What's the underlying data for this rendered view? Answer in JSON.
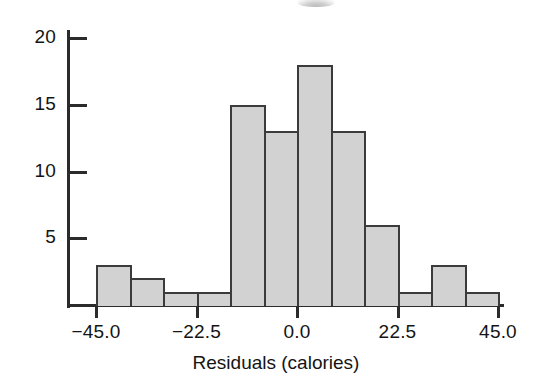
{
  "chart_data": {
    "type": "bar",
    "subtype": "histogram",
    "title": "",
    "xlabel": "Residuals (calories)",
    "ylabel": "",
    "grid": false,
    "legend": null,
    "bin_width": 7.5,
    "xlim": [
      -45.0,
      45.0
    ],
    "ylim": [
      0,
      21
    ],
    "xtick_labels": [
      "−45.0",
      "−22.5",
      "0.0",
      "22.5",
      "45.0"
    ],
    "xtick_values": [
      -45.0,
      -22.5,
      0.0,
      22.5,
      45.0
    ],
    "ytick_labels": [
      "5",
      "10",
      "15",
      "20"
    ],
    "ytick_values": [
      5,
      10,
      15,
      20
    ],
    "categories": [
      "-45.0 to -37.5",
      "-37.5 to -30.0",
      "-30.0 to -22.5",
      "-22.5 to -15.0",
      "-15.0 to -7.5",
      "-7.5 to 0.0",
      "0.0 to 7.5",
      "7.5 to 15.0",
      "15.0 to 22.5",
      "22.5 to 30.0",
      "30.0 to 37.5",
      "37.5 to 45.0"
    ],
    "bin_starts": [
      -45.0,
      -37.5,
      -30.0,
      -22.5,
      -15.0,
      -7.5,
      0.0,
      7.5,
      15.0,
      22.5,
      30.0,
      37.5
    ],
    "bin_ends": [
      -37.5,
      -30.0,
      -22.5,
      -15.0,
      -7.5,
      0.0,
      7.5,
      15.0,
      22.5,
      30.0,
      37.5,
      45.0
    ],
    "values": [
      3,
      2,
      1,
      1,
      15,
      13,
      18,
      13,
      6,
      1,
      3,
      1
    ],
    "total_count": 77,
    "colors": {
      "bar_fill": "#d2d2d2",
      "bar_stroke": "#3b3b3b",
      "axis": "#2b2b2b",
      "text": "#141414",
      "background": "#ffffff"
    }
  },
  "axes": {
    "x_title": "Residuals (calories)"
  }
}
